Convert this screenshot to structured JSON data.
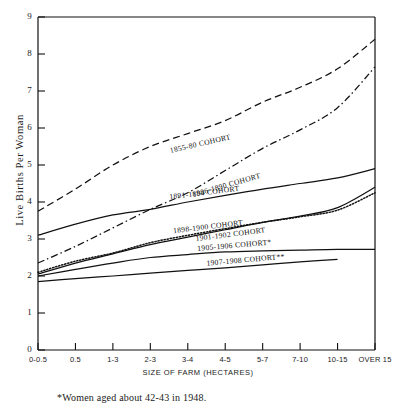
{
  "chart_data": {
    "type": "line",
    "title": "",
    "xlabel": "SIZE OF FARM (HECTARES)",
    "ylabel": "Live Births Per Woman",
    "ylim": [
      0,
      9
    ],
    "yticks": [
      0,
      1,
      2,
      3,
      4,
      5,
      6,
      7,
      8,
      9
    ],
    "grid": false,
    "legend": "inline-labels",
    "categories": [
      "0-0.5",
      "0.5",
      "1-3",
      "2-3",
      "3-4",
      "4-5",
      "5-7",
      "7-10",
      "10-15",
      "OVER 15"
    ],
    "series": [
      {
        "name": "1855-80 COHORT",
        "style": "dashed",
        "label": "1855-80 COHORT",
        "values": [
          3.75,
          4.35,
          5.0,
          5.5,
          5.85,
          6.2,
          6.7,
          7.1,
          7.6,
          8.4
        ]
      },
      {
        "name": "1886-1890 COHORT",
        "style": "dash-dot",
        "label": "1886-1890 COHORT",
        "values": [
          2.35,
          2.8,
          3.3,
          3.8,
          4.25,
          4.85,
          5.45,
          5.95,
          6.55,
          7.65
        ]
      },
      {
        "name": "1891-1894 COHORT",
        "style": "solid",
        "label": "1891-1894 COHORT",
        "values": [
          3.1,
          3.4,
          3.65,
          3.8,
          4.0,
          4.18,
          4.35,
          4.5,
          4.65,
          4.9
        ]
      },
      {
        "name": "1898-1900 COHORT",
        "style": "solid",
        "label": "1898-1900 COHORT",
        "values": [
          2.05,
          2.35,
          2.6,
          2.85,
          3.05,
          3.25,
          3.45,
          3.62,
          3.85,
          4.4
        ]
      },
      {
        "name": "1901-1902 COHORT",
        "style": "dotted",
        "label": "1901-1902 COHORT",
        "values": [
          2.1,
          2.4,
          2.62,
          2.9,
          3.1,
          3.28,
          3.45,
          3.6,
          3.78,
          4.25
        ]
      },
      {
        "name": "1905-1906 COHORT*",
        "style": "solid",
        "label": "1905-1906 COHORT*",
        "values": [
          2.0,
          2.18,
          2.35,
          2.5,
          2.58,
          2.65,
          2.68,
          2.7,
          2.72,
          2.72
        ]
      },
      {
        "name": "1907-1908 COHORT**",
        "style": "solid",
        "label": "1907-1908 COHORT**",
        "values": [
          1.85,
          1.93,
          2.0,
          2.08,
          2.15,
          2.22,
          2.3,
          2.38,
          2.45,
          null
        ]
      }
    ]
  },
  "footnote": "*Women aged about 42-43 in 1948."
}
